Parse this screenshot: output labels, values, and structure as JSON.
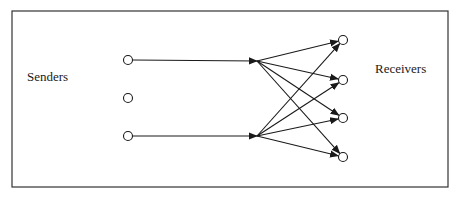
{
  "diagram": {
    "type": "multicast-network",
    "labels": {
      "senders": "Senders",
      "receivers": "Receivers"
    },
    "colors": {
      "stroke": "#1a1a1a",
      "frame": "#333333",
      "background": "#ffffff"
    },
    "frame": {
      "x": 12,
      "y": 11,
      "width": 436,
      "height": 176
    },
    "senders": [
      {
        "id": "s1",
        "x": 128,
        "y": 60,
        "connected": true
      },
      {
        "id": "s2",
        "x": 128,
        "y": 98,
        "connected": false
      },
      {
        "id": "s3",
        "x": 128,
        "y": 136,
        "connected": true
      }
    ],
    "hubs": [
      {
        "id": "h1",
        "x": 257,
        "y": 61,
        "from": "s1"
      },
      {
        "id": "h2",
        "x": 257,
        "y": 136,
        "from": "s3"
      }
    ],
    "receivers": [
      {
        "id": "r1",
        "x": 343,
        "y": 40
      },
      {
        "id": "r2",
        "x": 343,
        "y": 80
      },
      {
        "id": "r3",
        "x": 343,
        "y": 118
      },
      {
        "id": "r4",
        "x": 343,
        "y": 157
      }
    ],
    "edges": [
      {
        "from": "h1",
        "to": "r1"
      },
      {
        "from": "h1",
        "to": "r2"
      },
      {
        "from": "h1",
        "to": "r3"
      },
      {
        "from": "h1",
        "to": "r4"
      },
      {
        "from": "h2",
        "to": "r1"
      },
      {
        "from": "h2",
        "to": "r2"
      },
      {
        "from": "h2",
        "to": "r3"
      },
      {
        "from": "h2",
        "to": "r4"
      }
    ]
  }
}
